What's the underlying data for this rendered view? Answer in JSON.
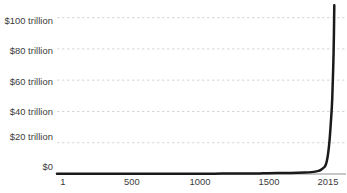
{
  "chart_data": {
    "type": "line",
    "title": "",
    "subtitle": "",
    "xlabel": "",
    "ylabel": "",
    "grid": true,
    "legend": false,
    "legend_position": "none",
    "series_color": "#1a1a1a",
    "grid_color": "#cfcfcf",
    "axis_color": "#b4b4b4",
    "text_color": "#3b3b3b",
    "background": "#ffffff",
    "xlim": [
      1,
      2100
    ],
    "ylim": [
      0,
      110
    ],
    "y_unit": "trillion USD",
    "y_ticks": [
      {
        "value": 100,
        "label": "$100 trillion"
      },
      {
        "value": 80,
        "label": "$80 trillion"
      },
      {
        "value": 60,
        "label": "$60 trillion"
      },
      {
        "value": 40,
        "label": "$40 trillion"
      },
      {
        "value": 20,
        "label": "$20 trillion"
      },
      {
        "value": 0,
        "label": "$0"
      }
    ],
    "x_ticks": [
      {
        "value": 1,
        "label": "1"
      },
      {
        "value": 500,
        "label": "500"
      },
      {
        "value": 1000,
        "label": "1000"
      },
      {
        "value": 1500,
        "label": "1500"
      },
      {
        "value": 2015,
        "label": "2015"
      }
    ],
    "series": [
      {
        "name": "World GDP",
        "x": [
          1,
          500,
          1000,
          1200,
          1400,
          1500,
          1600,
          1700,
          1800,
          1850,
          1900,
          1920,
          1940,
          1950,
          1960,
          1970,
          1980,
          1990,
          2000,
          2010,
          2015
        ],
        "values": [
          0.18,
          0.2,
          0.21,
          0.25,
          0.28,
          0.43,
          0.58,
          0.64,
          0.89,
          1.2,
          2.0,
          2.8,
          4.2,
          5.3,
          8.0,
          13.0,
          21.0,
          33.0,
          48.0,
          78.0,
          108.0
        ]
      }
    ],
    "annotations": []
  }
}
